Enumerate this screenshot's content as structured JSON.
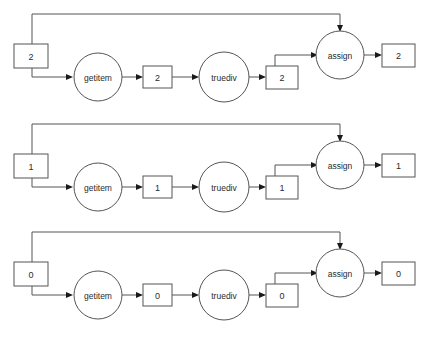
{
  "diagram": {
    "type": "computational-graph",
    "title": "",
    "background_color": "#ffffff",
    "edge_color": "#555555",
    "node_stroke_color": "#555555",
    "node_fill_color": "#ffffff",
    "text_color": "#2b2b2b",
    "row_count": 3,
    "rows": [
      {
        "index": 0,
        "value": "2",
        "input_box_value": "2",
        "getitem_label": "getitem",
        "getitem_output_value": "2",
        "truediv_label": "truediv",
        "truediv_output_value": "2",
        "assign_label": "assign",
        "assign_output_value": "2"
      },
      {
        "index": 1,
        "value": "1",
        "input_box_value": "1",
        "getitem_label": "getitem",
        "getitem_output_value": "1",
        "truediv_label": "truediv",
        "truediv_output_value": "1",
        "assign_label": "assign",
        "assign_output_value": "1"
      },
      {
        "index": 2,
        "value": "0",
        "input_box_value": "0",
        "getitem_label": "getitem",
        "getitem_output_value": "0",
        "truediv_label": "truediv",
        "truediv_output_value": "0",
        "assign_label": "assign",
        "assign_output_value": "0"
      }
    ]
  }
}
